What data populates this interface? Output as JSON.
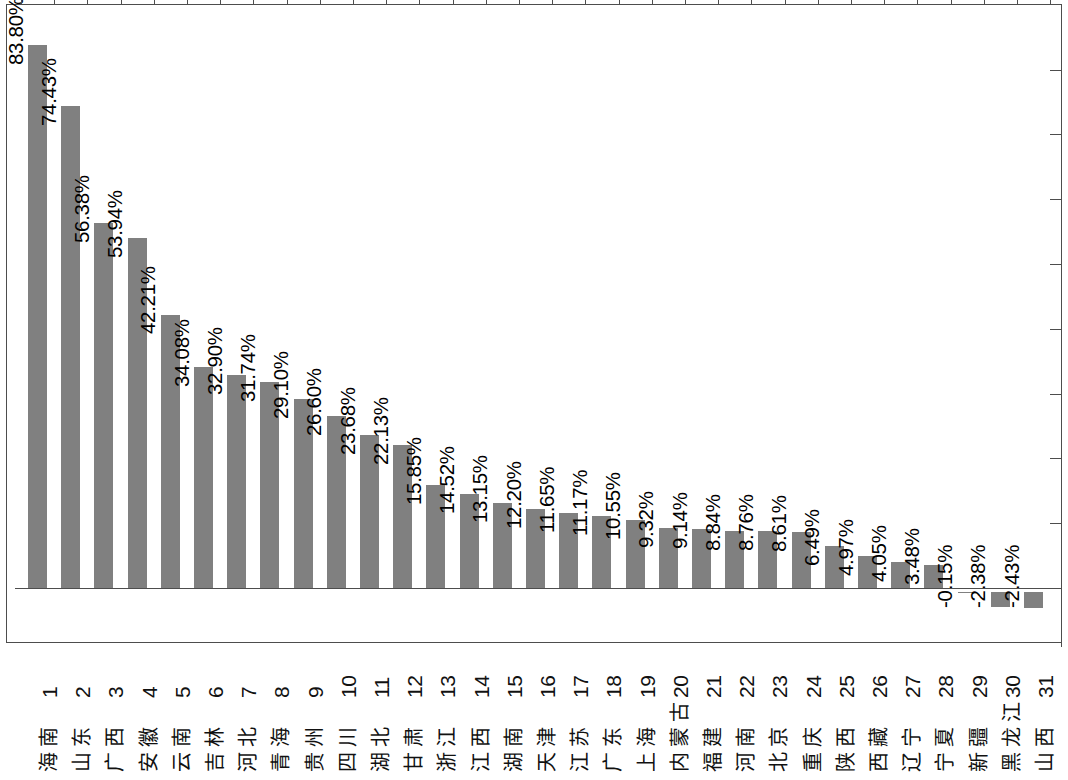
{
  "chart_data": {
    "type": "bar",
    "title": "",
    "subtitle": "",
    "xlabel": "",
    "ylabel": "",
    "value_suffix": "%",
    "grid": false,
    "legend": null,
    "orientation": "vertical",
    "bar_color": "#808080",
    "axis_color": "#4d4d4d",
    "ylim": [
      -10,
      90
    ],
    "y_tick_interval": 10,
    "y_tick_labels_shown": false,
    "categories": [
      "海南",
      "山东",
      "广西",
      "安徽",
      "云南",
      "吉林",
      "河北",
      "青海",
      "贵州",
      "四川",
      "湖北",
      "甘肃",
      "浙江",
      "江西",
      "湖南",
      "天津",
      "江苏",
      "广东",
      "上海",
      "内蒙古",
      "福建",
      "河南",
      "北京",
      "重庆",
      "陕西",
      "西藏",
      "辽宁",
      "宁夏",
      "新疆",
      "黑龙江",
      "山西"
    ],
    "index_labels": [
      "1",
      "2",
      "3",
      "4",
      "5",
      "6",
      "7",
      "8",
      "9",
      "10",
      "11",
      "12",
      "13",
      "14",
      "15",
      "16",
      "17",
      "18",
      "19",
      "20",
      "21",
      "22",
      "23",
      "24",
      "25",
      "26",
      "27",
      "28",
      "29",
      "30",
      "31"
    ],
    "values": [
      83.8,
      74.43,
      56.38,
      53.94,
      42.21,
      34.08,
      32.9,
      31.74,
      29.1,
      26.6,
      23.68,
      22.13,
      15.85,
      14.52,
      13.15,
      12.2,
      11.65,
      11.17,
      10.55,
      9.32,
      9.14,
      8.84,
      8.76,
      8.61,
      6.49,
      4.97,
      4.05,
      3.48,
      -0.15,
      -2.38,
      -2.43
    ],
    "data_labels": [
      "83.80%",
      "74.43%",
      "56.38%",
      "53.94%",
      "42.21%",
      "34.08%",
      "32.90%",
      "31.74%",
      "29.10%",
      "26.60%",
      "23.68%",
      "22.13%",
      "15.85%",
      "14.52%",
      "13.15%",
      "12.20%",
      "11.65%",
      "11.17%",
      "10.55%",
      "9.32%",
      "9.14%",
      "8.84%",
      "8.76%",
      "8.61%",
      "6.49%",
      "4.97%",
      "4.05%",
      "3.48%",
      "-0.15%",
      "-2.38%",
      "-2.43%"
    ]
  }
}
